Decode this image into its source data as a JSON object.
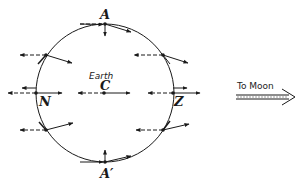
{
  "diagram": {
    "body_label": "Earth",
    "center_label": "C",
    "points": [
      {
        "id": "A",
        "label": "A"
      },
      {
        "id": "A-prime",
        "label": "A′"
      },
      {
        "id": "N",
        "label": "N"
      },
      {
        "id": "Z",
        "label": "Z"
      }
    ],
    "direction_label": "To Moon",
    "legend": {
      "solid_arrow": "actual attraction",
      "dashed_arrow": "average attraction"
    },
    "colors": {
      "ink": "#1a1a1a",
      "background": "#ffffff"
    }
  }
}
